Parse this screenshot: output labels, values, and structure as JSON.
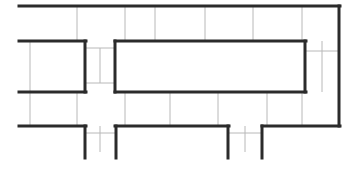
{
  "document": {
    "type": "floor-plan-line-drawing",
    "title": "",
    "width": 357,
    "height": 171,
    "background_color": "#ffffff"
  },
  "styles": {
    "wall_color": "#2b2b2b",
    "wall_thickness": 3,
    "grid_color": "#b8b8b8",
    "grid_thickness": 1
  },
  "geometry": {
    "walls": [
      {
        "name": "top-outer-wall",
        "x1": 19,
        "y1": 6,
        "x2": 340,
        "y2": 6
      },
      {
        "name": "right-outer-wall",
        "x1": 339,
        "y1": 6,
        "x2": 339,
        "y2": 126
      },
      {
        "name": "left-upper-wall",
        "x1": 19,
        "y1": 41,
        "x2": 86,
        "y2": 41
      },
      {
        "name": "left-lower-wall",
        "x1": 19,
        "y1": 92,
        "x2": 86,
        "y2": 92
      },
      {
        "name": "left-bay-right-wall",
        "x1": 85,
        "y1": 41,
        "x2": 85,
        "y2": 92
      },
      {
        "name": "left-bottom-wall",
        "x1": 19,
        "y1": 126,
        "x2": 86,
        "y2": 126
      },
      {
        "name": "left-fin-wall",
        "x1": 85,
        "y1": 126,
        "x2": 85,
        "y2": 158
      },
      {
        "name": "center-room-top-wall",
        "x1": 115,
        "y1": 41,
        "x2": 306,
        "y2": 41
      },
      {
        "name": "center-room-bottom-wall",
        "x1": 115,
        "y1": 92,
        "x2": 306,
        "y2": 92
      },
      {
        "name": "center-room-left-wall",
        "x1": 115,
        "y1": 41,
        "x2": 115,
        "y2": 92
      },
      {
        "name": "center-room-right-wall",
        "x1": 305,
        "y1": 41,
        "x2": 305,
        "y2": 92
      },
      {
        "name": "center-bottom-wall",
        "x1": 115,
        "y1": 126,
        "x2": 229,
        "y2": 126
      },
      {
        "name": "center-fin-left-wall",
        "x1": 116,
        "y1": 126,
        "x2": 116,
        "y2": 158
      },
      {
        "name": "center-fin-right-wall",
        "x1": 228,
        "y1": 126,
        "x2": 228,
        "y2": 158
      },
      {
        "name": "right-bottom-wall",
        "x1": 262,
        "y1": 126,
        "x2": 340,
        "y2": 126
      },
      {
        "name": "right-fin-wall",
        "x1": 262,
        "y1": 126,
        "x2": 262,
        "y2": 158
      }
    ],
    "grid_lines": [
      {
        "name": "grid-v-top-1",
        "x1": 77,
        "y1": 7,
        "x2": 77,
        "y2": 41
      },
      {
        "name": "grid-v-top-2",
        "x1": 125,
        "y1": 7,
        "x2": 125,
        "y2": 41
      },
      {
        "name": "grid-v-top-3",
        "x1": 155,
        "y1": 7,
        "x2": 155,
        "y2": 41
      },
      {
        "name": "grid-v-top-4",
        "x1": 205,
        "y1": 7,
        "x2": 205,
        "y2": 41
      },
      {
        "name": "grid-v-top-5",
        "x1": 253,
        "y1": 7,
        "x2": 253,
        "y2": 41
      },
      {
        "name": "grid-v-top-6",
        "x1": 302,
        "y1": 7,
        "x2": 302,
        "y2": 41
      },
      {
        "name": "grid-v-left-upper",
        "x1": 30,
        "y1": 41,
        "x2": 30,
        "y2": 92
      },
      {
        "name": "grid-h-bay-top",
        "x1": 85,
        "y1": 48,
        "x2": 116,
        "y2": 48
      },
      {
        "name": "grid-h-bay-bottom",
        "x1": 85,
        "y1": 83,
        "x2": 116,
        "y2": 83
      },
      {
        "name": "grid-v-bay",
        "x1": 100,
        "y1": 48,
        "x2": 100,
        "y2": 83
      },
      {
        "name": "grid-h-right-mid",
        "x1": 305,
        "y1": 51,
        "x2": 339,
        "y2": 51
      },
      {
        "name": "grid-v-right-mid",
        "x1": 322,
        "y1": 41,
        "x2": 322,
        "y2": 92
      },
      {
        "name": "grid-v-low-1",
        "x1": 30,
        "y1": 92,
        "x2": 30,
        "y2": 126
      },
      {
        "name": "grid-v-low-2",
        "x1": 77,
        "y1": 92,
        "x2": 77,
        "y2": 126
      },
      {
        "name": "grid-v-low-3",
        "x1": 125,
        "y1": 92,
        "x2": 125,
        "y2": 126
      },
      {
        "name": "grid-v-low-4",
        "x1": 170,
        "y1": 92,
        "x2": 170,
        "y2": 126
      },
      {
        "name": "grid-v-low-5",
        "x1": 218,
        "y1": 92,
        "x2": 218,
        "y2": 126
      },
      {
        "name": "grid-v-low-6",
        "x1": 267,
        "y1": 92,
        "x2": 267,
        "y2": 126
      },
      {
        "name": "grid-v-low-7",
        "x1": 302,
        "y1": 92,
        "x2": 302,
        "y2": 126
      },
      {
        "name": "grid-h-fin-left",
        "x1": 85,
        "y1": 133,
        "x2": 117,
        "y2": 133
      },
      {
        "name": "grid-h-fin-right",
        "x1": 228,
        "y1": 133,
        "x2": 263,
        "y2": 133
      },
      {
        "name": "grid-v-fin-stub-a",
        "x1": 100,
        "y1": 126,
        "x2": 100,
        "y2": 152
      },
      {
        "name": "grid-v-fin-stub-b",
        "x1": 245,
        "y1": 126,
        "x2": 245,
        "y2": 152
      }
    ]
  }
}
